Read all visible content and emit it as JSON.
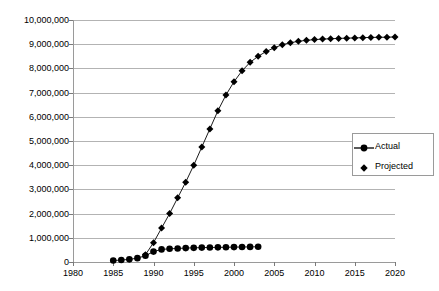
{
  "chart_data": {
    "type": "line",
    "title": "",
    "subtitle": "",
    "xlabel": "",
    "ylabel": "",
    "xlim": [
      1980,
      2020
    ],
    "ylim": [
      0,
      10000000
    ],
    "grid": true,
    "legend_position": "right-middle",
    "y_ticks": [
      {
        "value": 10000000,
        "label": "10,000,000"
      },
      {
        "value": 9000000,
        "label": "9,000,000"
      },
      {
        "value": 8000000,
        "label": "8,000,000"
      },
      {
        "value": 7000000,
        "label": "7,000,000"
      },
      {
        "value": 6000000,
        "label": "6,000,000"
      },
      {
        "value": 5000000,
        "label": "5,000,000"
      },
      {
        "value": 4000000,
        "label": "4,000,000"
      },
      {
        "value": 3000000,
        "label": "3,000,000"
      },
      {
        "value": 2000000,
        "label": "2,000,000"
      },
      {
        "value": 1000000,
        "label": "1,000,000"
      },
      {
        "value": 0,
        "label": "0"
      }
    ],
    "x_ticks": [
      {
        "value": 1980,
        "label": "1980"
      },
      {
        "value": 1985,
        "label": "1985"
      },
      {
        "value": 1990,
        "label": "1990"
      },
      {
        "value": 1995,
        "label": "1995"
      },
      {
        "value": 2000,
        "label": "2000"
      },
      {
        "value": 2005,
        "label": "2005"
      },
      {
        "value": 2010,
        "label": "2010"
      },
      {
        "value": 2015,
        "label": "2015"
      },
      {
        "value": 2020,
        "label": "2020"
      }
    ],
    "series": [
      {
        "name": "Actual",
        "marker": "circle",
        "color": "#000000",
        "line": true,
        "x": [
          1985,
          1986,
          1987,
          1988,
          1989,
          1990,
          1991,
          1992,
          1993,
          1994,
          1995,
          1996,
          1997,
          1998,
          1999,
          2000,
          2001,
          2002,
          2003
        ],
        "values": [
          60000,
          80000,
          110000,
          160000,
          260000,
          430000,
          520000,
          545000,
          560000,
          575000,
          585000,
          595000,
          600000,
          605000,
          610000,
          615000,
          620000,
          625000,
          630000
        ]
      },
      {
        "name": "Projected",
        "marker": "diamond",
        "color": "#000000",
        "line": true,
        "x": [
          1989,
          1990,
          1991,
          1992,
          1993,
          1994,
          1995,
          1996,
          1997,
          1998,
          1999,
          2000,
          2001,
          2002,
          2003,
          2004,
          2005,
          2006,
          2007,
          2008,
          2009,
          2010,
          2011,
          2012,
          2013,
          2014,
          2015,
          2016,
          2017,
          2018,
          2019,
          2020
        ],
        "values": [
          300000,
          800000,
          1400000,
          2000000,
          2650000,
          3300000,
          4000000,
          4750000,
          5500000,
          6250000,
          6900000,
          7450000,
          7900000,
          8250000,
          8500000,
          8700000,
          8850000,
          8980000,
          9060000,
          9120000,
          9160000,
          9190000,
          9210000,
          9225000,
          9240000,
          9250000,
          9260000,
          9270000,
          9280000,
          9285000,
          9290000,
          9300000
        ]
      }
    ]
  },
  "legend": {
    "items": [
      {
        "label": "Actual"
      },
      {
        "label": "Projected"
      }
    ]
  }
}
